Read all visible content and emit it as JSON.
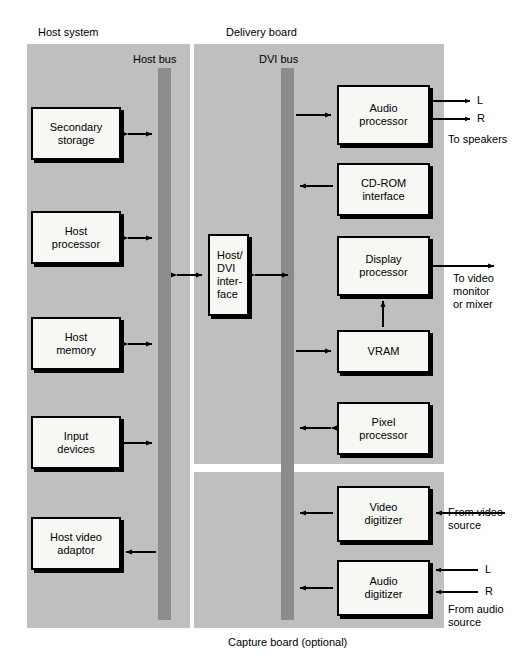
{
  "diagram": {
    "background": "#ffffff",
    "panel_color": "#bfbfbf",
    "bus_color": "#8c8c8c",
    "box_fill": "#f7f7f4",
    "line_color": "#000000"
  },
  "panels": [
    {
      "id": "host-system",
      "label": "Host system",
      "x": 27,
      "y": 44,
      "w": 163,
      "h": 584
    },
    {
      "id": "delivery-board",
      "label": "Delivery board",
      "x": 194,
      "y": 44,
      "w": 250,
      "h": 420
    },
    {
      "id": "capture-board",
      "label": "Capture board (optional)",
      "x": 194,
      "y": 472,
      "w": 250,
      "h": 156
    }
  ],
  "panel_captions": [
    {
      "id": "host-system-caption",
      "text": "Host system",
      "x": 38,
      "y": 26
    },
    {
      "id": "delivery-board-caption",
      "text": "Delivery board",
      "x": 226,
      "y": 26
    },
    {
      "id": "capture-board-caption",
      "text": "Capture board (optional)",
      "x": 228,
      "y": 636
    }
  ],
  "buses": [
    {
      "id": "host-bus",
      "label": "Host bus",
      "label_x": 133,
      "label_y": 53,
      "x": 158,
      "y": 68,
      "w": 13,
      "h": 552
    },
    {
      "id": "dvi-bus",
      "label": "DVI bus",
      "label_x": 259,
      "label_y": 53,
      "x": 281,
      "y": 68,
      "w": 13,
      "h": 552
    }
  ],
  "boxes": [
    {
      "id": "secondary-storage",
      "label": "Secondary\nstorage",
      "x": 31,
      "y": 107,
      "w": 90,
      "h": 53,
      "align": "center"
    },
    {
      "id": "host-processor",
      "label": "Host\nprocessor",
      "x": 31,
      "y": 211,
      "w": 90,
      "h": 53,
      "align": "center"
    },
    {
      "id": "host-memory",
      "label": "Host\nmemory",
      "x": 31,
      "y": 317,
      "w": 90,
      "h": 53,
      "align": "center"
    },
    {
      "id": "input-devices",
      "label": "Input\ndevices",
      "x": 31,
      "y": 416,
      "w": 90,
      "h": 53,
      "align": "center"
    },
    {
      "id": "host-video-adaptor",
      "label": "Host video\nadaptor",
      "x": 31,
      "y": 517,
      "w": 90,
      "h": 53,
      "align": "center"
    },
    {
      "id": "host-dvi-interface",
      "label": "Host/\nDVI\ninter-\nface",
      "x": 208,
      "y": 234,
      "w": 41,
      "h": 82,
      "align": "left"
    },
    {
      "id": "audio-processor",
      "label": "Audio\nprocessor",
      "x": 337,
      "y": 85,
      "w": 93,
      "h": 60,
      "align": "center"
    },
    {
      "id": "cd-rom-interface",
      "label": "CD-ROM\ninterface",
      "x": 337,
      "y": 163,
      "w": 93,
      "h": 53,
      "align": "center"
    },
    {
      "id": "display-processor",
      "label": "Display\nprocessor",
      "x": 337,
      "y": 236,
      "w": 93,
      "h": 60,
      "align": "center"
    },
    {
      "id": "vram",
      "label": "VRAM",
      "x": 337,
      "y": 330,
      "w": 93,
      "h": 43,
      "align": "center"
    },
    {
      "id": "pixel-processor",
      "label": "Pixel\nprocessor",
      "x": 337,
      "y": 402,
      "w": 93,
      "h": 53,
      "align": "center"
    },
    {
      "id": "video-digitizer",
      "label": "Video\ndigitizer",
      "x": 337,
      "y": 486,
      "w": 93,
      "h": 56,
      "align": "center"
    },
    {
      "id": "audio-digitizer",
      "label": "Audio\ndigitizer",
      "x": 337,
      "y": 560,
      "w": 93,
      "h": 56,
      "align": "center"
    }
  ],
  "external_labels": [
    {
      "id": "speaker-left",
      "text": "L",
      "x": 477,
      "y": 98
    },
    {
      "id": "speaker-right",
      "text": "R",
      "x": 477,
      "y": 116
    },
    {
      "id": "to-speakers",
      "text": "To speakers",
      "x": 448,
      "y": 135
    },
    {
      "id": "to-video-monitor",
      "text": "To video\nmonitor\nor mixer",
      "x": 453,
      "y": 258
    },
    {
      "id": "from-video-source",
      "text": "From video\nsource",
      "x": 448,
      "y": 500
    },
    {
      "id": "audio-in-left",
      "text": "L",
      "x": 485,
      "y": 566
    },
    {
      "id": "audio-in-right",
      "text": "R",
      "x": 485,
      "y": 588
    },
    {
      "id": "from-audio-source",
      "text": "From audio\nsource",
      "x": 448,
      "y": 605
    }
  ],
  "connections": [
    {
      "id": "secondary-storage-to-host-bus",
      "from": "secondary-storage",
      "to": "host-bus",
      "direction": "bidirectional"
    },
    {
      "id": "host-processor-to-host-bus",
      "from": "host-processor",
      "to": "host-bus",
      "direction": "bidirectional"
    },
    {
      "id": "host-memory-to-host-bus",
      "from": "host-memory",
      "to": "host-bus",
      "direction": "bidirectional"
    },
    {
      "id": "input-devices-to-host-bus",
      "from": "input-devices",
      "to": "host-bus",
      "direction": "to-bus"
    },
    {
      "id": "host-bus-to-host-video-adaptor",
      "from": "host-bus",
      "to": "host-video-adaptor",
      "direction": "from-bus"
    },
    {
      "id": "host-bus-to-interface",
      "from": "host-bus",
      "to": "host-dvi-interface",
      "direction": "bidirectional"
    },
    {
      "id": "interface-to-dvi-bus",
      "from": "host-dvi-interface",
      "to": "dvi-bus",
      "direction": "bidirectional"
    },
    {
      "id": "dvi-bus-to-audio-processor",
      "from": "dvi-bus",
      "to": "audio-processor",
      "direction": "from-bus"
    },
    {
      "id": "cd-rom-to-dvi-bus",
      "from": "cd-rom-interface",
      "to": "dvi-bus",
      "direction": "to-bus"
    },
    {
      "id": "dvi-bus-to-vram",
      "from": "dvi-bus",
      "to": "vram",
      "direction": "from-bus"
    },
    {
      "id": "vram-to-display-processor",
      "from": "vram",
      "to": "display-processor",
      "direction": "upward"
    },
    {
      "id": "pixel-processor-to-dvi-bus",
      "from": "pixel-processor",
      "to": "dvi-bus",
      "direction": "bidirectional"
    },
    {
      "id": "video-digitizer-to-dvi-bus",
      "from": "video-digitizer",
      "to": "dvi-bus",
      "direction": "to-bus"
    },
    {
      "id": "audio-digitizer-to-dvi-bus",
      "from": "audio-digitizer",
      "to": "dvi-bus",
      "direction": "to-bus"
    },
    {
      "id": "audio-processor-to-speakers",
      "from": "audio-processor",
      "to": "speakers",
      "direction": "output"
    },
    {
      "id": "display-processor-to-monitor",
      "from": "display-processor",
      "to": "monitor",
      "direction": "output"
    },
    {
      "id": "video-source-to-digitizer",
      "from": "video-source",
      "to": "video-digitizer",
      "direction": "input"
    },
    {
      "id": "audio-source-to-digitizer",
      "from": "audio-source",
      "to": "audio-digitizer",
      "direction": "input"
    }
  ]
}
